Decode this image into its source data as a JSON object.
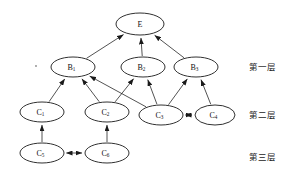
{
  "diagram": {
    "type": "hierarchical-node-graph",
    "background_color": "#ffffff",
    "stroke_color": "#1a1a1a",
    "node_fill": "#ffffff",
    "nodes": [
      {
        "id": "E",
        "base": "E",
        "sub": "",
        "cx": 140,
        "cy": 24,
        "rx": 24,
        "ry": 11
      },
      {
        "id": "B1",
        "base": "B",
        "sub": "1",
        "cx": 73,
        "cy": 67,
        "rx": 22,
        "ry": 10
      },
      {
        "id": "B2",
        "base": "B",
        "sub": "2",
        "cx": 143,
        "cy": 67,
        "rx": 22,
        "ry": 10
      },
      {
        "id": "B3",
        "base": "B",
        "sub": "3",
        "cx": 196,
        "cy": 67,
        "rx": 22,
        "ry": 10
      },
      {
        "id": "C1",
        "base": "C",
        "sub": "1",
        "cx": 42,
        "cy": 112,
        "rx": 22,
        "ry": 10
      },
      {
        "id": "C2",
        "base": "C",
        "sub": "2",
        "cx": 107,
        "cy": 112,
        "rx": 22,
        "ry": 10
      },
      {
        "id": "C3",
        "base": "C",
        "sub": "3",
        "cx": 161,
        "cy": 115,
        "rx": 22,
        "ry": 10
      },
      {
        "id": "C4",
        "base": "C",
        "sub": "4",
        "cx": 215,
        "cy": 115,
        "rx": 20,
        "ry": 10
      },
      {
        "id": "C5",
        "base": "C",
        "sub": "5",
        "cx": 42,
        "cy": 153,
        "rx": 22,
        "ry": 10
      },
      {
        "id": "C6",
        "base": "C",
        "sub": "6",
        "cx": 107,
        "cy": 153,
        "rx": 22,
        "ry": 10
      }
    ],
    "edges": [
      {
        "from": "B1",
        "to": "E",
        "arrow": "single"
      },
      {
        "from": "B2",
        "to": "E",
        "arrow": "single"
      },
      {
        "from": "B3",
        "to": "E",
        "arrow": "single"
      },
      {
        "from": "C1",
        "to": "B1",
        "arrow": "single"
      },
      {
        "from": "C2",
        "to": "B1",
        "arrow": "single"
      },
      {
        "from": "C2",
        "to": "B2",
        "arrow": "single"
      },
      {
        "from": "C3",
        "to": "B1",
        "arrow": "single"
      },
      {
        "from": "C3",
        "to": "B2",
        "arrow": "single"
      },
      {
        "from": "C3",
        "to": "B3",
        "arrow": "single"
      },
      {
        "from": "C4",
        "to": "B3",
        "arrow": "single"
      },
      {
        "from": "C5",
        "to": "C1",
        "arrow": "single"
      },
      {
        "from": "C6",
        "to": "C2",
        "arrow": "single"
      },
      {
        "from": "C3",
        "to": "C4",
        "arrow": "double"
      },
      {
        "from": "C5",
        "to": "C6",
        "arrow": "double"
      }
    ],
    "layer_labels": [
      {
        "id": "layer-1",
        "text": "第一层",
        "x": 249,
        "y": 67
      },
      {
        "id": "layer-2",
        "text": "第二层",
        "x": 249,
        "y": 115
      },
      {
        "id": "layer-3",
        "text": "第三层",
        "x": 249,
        "y": 157
      }
    ]
  }
}
